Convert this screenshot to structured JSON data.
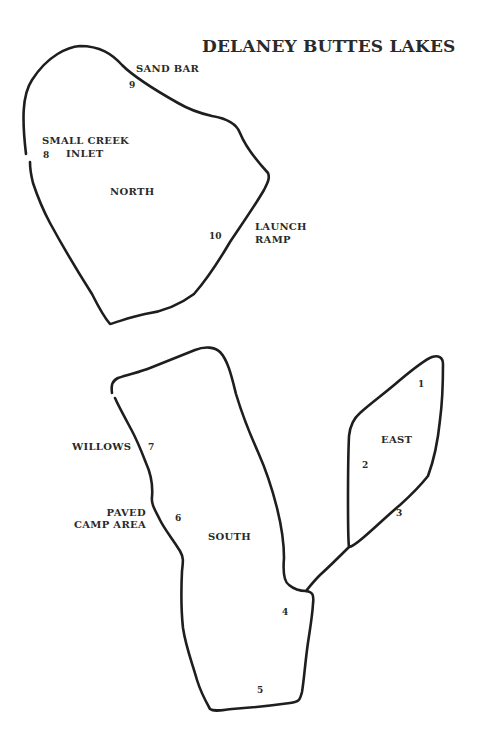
{
  "title": "DELANEY BUTTES LAKES",
  "lakes": {
    "north": {
      "label": "NORTH"
    },
    "south": {
      "label": "SOUTH"
    },
    "east": {
      "label": "EAST"
    }
  },
  "features": {
    "sand_bar": "SAND BAR",
    "small_creek": "SMALL CREEK",
    "inlet": "INLET",
    "launch": "LAUNCH",
    "ramp": "RAMP",
    "willows": "WILLOWS",
    "paved": "PAVED",
    "camp_area": "CAMP AREA"
  },
  "markers": [
    "1",
    "2",
    "3",
    "4",
    "5",
    "6",
    "7",
    "8",
    "9",
    "10"
  ],
  "colors": {
    "outline": "#1e1e1e",
    "text": "#2a2a2a",
    "background": "#ffffff"
  }
}
